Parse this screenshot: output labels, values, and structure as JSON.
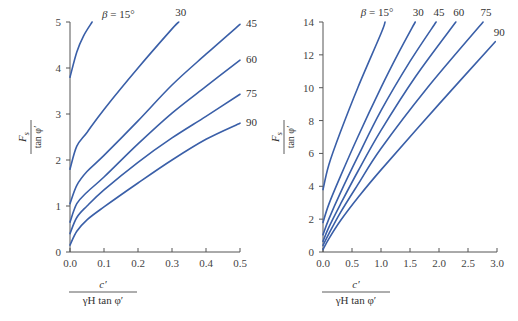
{
  "chart_data": [
    {
      "type": "line",
      "title": "",
      "xlabel": "c′ / (γH tan φ′)",
      "ylabel": "F_s / tan φ′",
      "xlim": [
        0,
        0.5
      ],
      "ylim": [
        0,
        5
      ],
      "x_ticks": [
        "0.0",
        "0.1",
        "0.2",
        "0.3",
        "0.4",
        "0.5"
      ],
      "y_ticks": [
        "0",
        "1",
        "2",
        "3",
        "4",
        "5"
      ],
      "grid": false,
      "legend": "inline curve labels at line ends",
      "series": [
        {
          "name": "β = 15°",
          "label": "β = 15°",
          "x": [
            0,
            0.02,
            0.04,
            0.065
          ],
          "y": [
            3.8,
            4.35,
            4.7,
            5.0
          ]
        },
        {
          "name": "30",
          "label": "30",
          "x": [
            0,
            0.02,
            0.05,
            0.1,
            0.2,
            0.3,
            0.32
          ],
          "y": [
            1.8,
            2.3,
            2.6,
            3.1,
            4.0,
            4.85,
            5.0
          ]
        },
        {
          "name": "45",
          "label": "45",
          "x": [
            0,
            0.02,
            0.05,
            0.1,
            0.2,
            0.3,
            0.4,
            0.5
          ],
          "y": [
            1.05,
            1.45,
            1.75,
            2.1,
            2.85,
            3.63,
            4.3,
            4.95
          ]
        },
        {
          "name": "60",
          "label": "60",
          "x": [
            0,
            0.02,
            0.05,
            0.1,
            0.2,
            0.3,
            0.4,
            0.5
          ],
          "y": [
            0.65,
            1.05,
            1.3,
            1.63,
            2.35,
            3.02,
            3.6,
            4.17
          ]
        },
        {
          "name": "75",
          "label": "75",
          "x": [
            0,
            0.02,
            0.05,
            0.1,
            0.2,
            0.3,
            0.4,
            0.5
          ],
          "y": [
            0.4,
            0.75,
            1.0,
            1.35,
            1.95,
            2.48,
            2.95,
            3.43
          ]
        },
        {
          "name": "90",
          "label": "90",
          "x": [
            0,
            0.02,
            0.05,
            0.1,
            0.2,
            0.3,
            0.4,
            0.5
          ],
          "y": [
            0.15,
            0.45,
            0.7,
            0.98,
            1.5,
            2.0,
            2.45,
            2.8
          ]
        }
      ]
    },
    {
      "type": "line",
      "title": "",
      "xlabel": "c′ / (γH tan φ′)",
      "ylabel": "F_s / tan φ′",
      "xlim": [
        0,
        3.0
      ],
      "ylim": [
        0,
        14
      ],
      "x_ticks": [
        "0.0",
        "0.5",
        "1.0",
        "1.5",
        "2.0",
        "2.5",
        "3.0"
      ],
      "y_ticks": [
        "0",
        "2",
        "4",
        "6",
        "8",
        "10",
        "12",
        "14"
      ],
      "grid": false,
      "legend": "inline curve labels at line ends",
      "series": [
        {
          "name": "β = 15°",
          "label": "β = 15°",
          "x": [
            0,
            0.1,
            0.3,
            0.6,
            1.0,
            1.07
          ],
          "y": [
            3.8,
            5.3,
            7.3,
            10.0,
            13.3,
            14.0
          ]
        },
        {
          "name": "30",
          "label": "30",
          "x": [
            0,
            0.1,
            0.3,
            0.6,
            1.0,
            1.3,
            1.59
          ],
          "y": [
            1.8,
            2.9,
            4.6,
            7.0,
            10.0,
            12.1,
            14.0
          ]
        },
        {
          "name": "45",
          "label": "45",
          "x": [
            0,
            0.1,
            0.3,
            0.6,
            1.0,
            1.5,
            1.95
          ],
          "y": [
            1.05,
            2.0,
            3.6,
            5.8,
            8.6,
            11.6,
            14.0
          ]
        },
        {
          "name": "60",
          "label": "60",
          "x": [
            0,
            0.1,
            0.3,
            0.6,
            1.0,
            1.6,
            2.29
          ],
          "y": [
            0.65,
            1.5,
            2.9,
            4.9,
            7.4,
            10.7,
            14.0
          ]
        },
        {
          "name": "75",
          "label": "75",
          "x": [
            0,
            0.1,
            0.3,
            0.6,
            1.0,
            1.8,
            2.76
          ],
          "y": [
            0.4,
            1.1,
            2.4,
            4.1,
            6.3,
            10.0,
            14.0
          ]
        },
        {
          "name": "90",
          "label": "90",
          "x": [
            0,
            0.1,
            0.3,
            0.6,
            1.0,
            2.0,
            2.97
          ],
          "y": [
            0.15,
            0.8,
            1.9,
            3.3,
            5.0,
            9.0,
            12.8
          ]
        }
      ]
    }
  ],
  "style": {
    "curve_color": "#3a5fa8",
    "axis_color": "#555555"
  },
  "labels": {
    "y_numerator": "F",
    "y_subscript": "s",
    "y_denominator": "tan φ′",
    "x_numerator": "c′",
    "x_denominator": "γH tan φ′"
  }
}
